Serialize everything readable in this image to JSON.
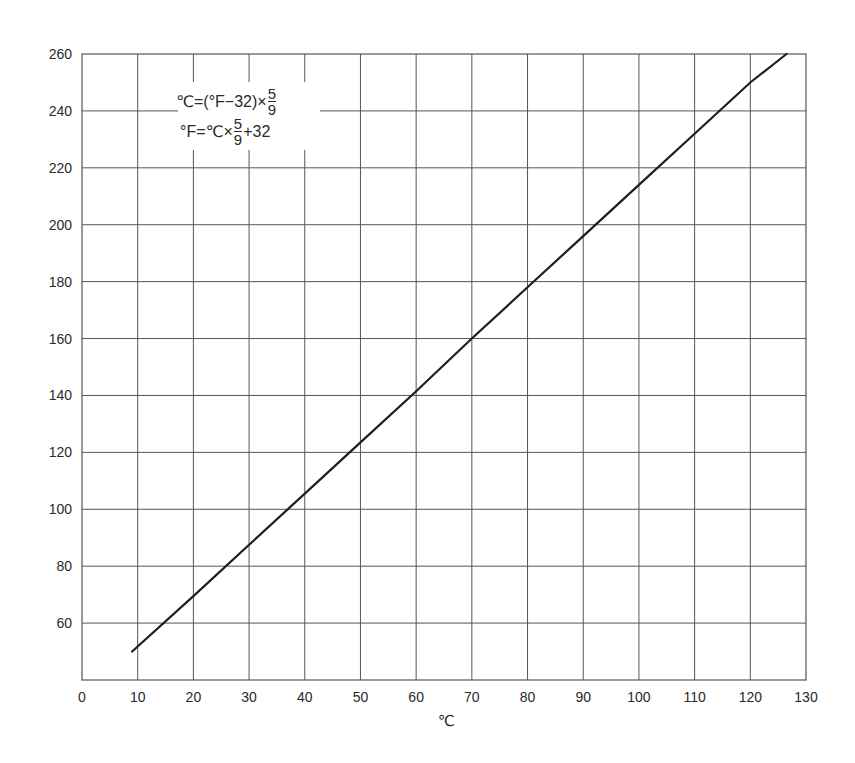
{
  "chart_data": {
    "type": "line",
    "title": "",
    "xlabel": "℃",
    "ylabel": "",
    "xlim": [
      0,
      130
    ],
    "ylim": [
      40,
      260
    ],
    "x_ticks": [
      0,
      10,
      20,
      30,
      40,
      50,
      60,
      70,
      80,
      90,
      100,
      110,
      120,
      130
    ],
    "y_ticks": [
      60,
      80,
      100,
      120,
      140,
      160,
      180,
      200,
      220,
      240,
      260
    ],
    "grid": true,
    "legend": null,
    "series": [
      {
        "name": "Celsius to Fahrenheit",
        "x": [
          9,
          20,
          30,
          40,
          50,
          60,
          70,
          80,
          90,
          100,
          110,
          120,
          126.5
        ],
        "y": [
          50,
          69.5,
          87.5,
          105.5,
          123.5,
          141.5,
          160,
          178,
          196,
          214,
          232,
          250,
          260
        ]
      }
    ],
    "annotations": {
      "formula_1": {
        "lhs": "℃=(°F−32)×",
        "num": "5",
        "den": "9",
        "rhs": ""
      },
      "formula_2": {
        "lhs": "°F=℃×",
        "num": "5",
        "den": "9",
        "rhs": "+32"
      }
    }
  }
}
